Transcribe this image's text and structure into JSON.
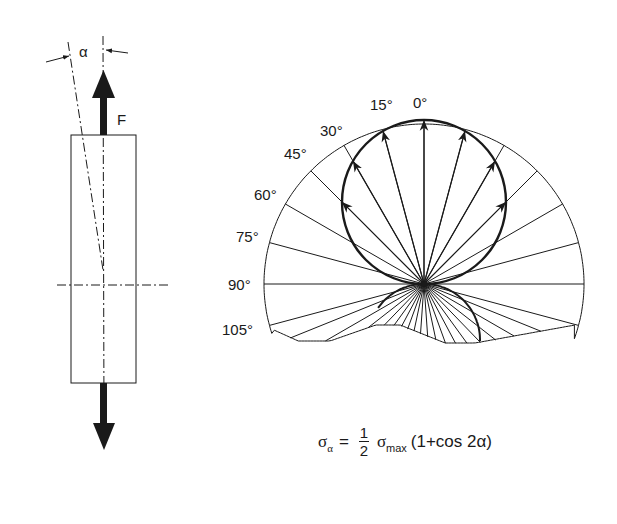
{
  "figure": {
    "left_diagram": {
      "force_label": "F",
      "angle_label": "α"
    },
    "polar_diagram": {
      "angle_labels": [
        "0°",
        "15°",
        "30°",
        "45°",
        "60°",
        "75°",
        "90°",
        "105°"
      ]
    },
    "formula": {
      "lhs_symbol": "σ",
      "lhs_sub": "α",
      "equals": "=",
      "frac_num": "1",
      "frac_den": "2",
      "sigma": "σ",
      "sigma_sub": "max",
      "rest": "(1+cos 2α)"
    }
  },
  "colors": {
    "ink": "#1a1a1a",
    "background": "#ffffff"
  }
}
